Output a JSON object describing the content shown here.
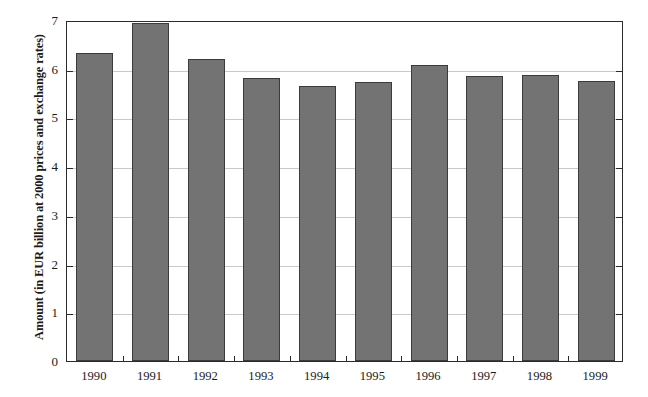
{
  "chart_data": {
    "type": "bar",
    "title": "",
    "subtitle": "",
    "xlabel": "",
    "ylabel": "Amount (in EUR billion at 2000 prices and exchange rates)",
    "categories": [
      "1990",
      "1991",
      "1992",
      "1993",
      "1994",
      "1995",
      "1996",
      "1997",
      "1998",
      "1999"
    ],
    "values": [
      6.33,
      6.93,
      6.2,
      5.8,
      5.64,
      5.72,
      6.07,
      5.86,
      5.88,
      5.74
    ],
    "series": [
      {
        "name": "Amount",
        "values": [
          6.33,
          6.93,
          6.2,
          5.8,
          5.64,
          5.72,
          6.07,
          5.86,
          5.88,
          5.74
        ]
      }
    ],
    "ylim": [
      0,
      7
    ],
    "yticks": [
      0,
      1,
      2,
      3,
      4,
      5,
      6,
      7
    ],
    "ytick_labels": [
      "0",
      "1",
      "2",
      "3",
      "4",
      "5",
      "6",
      "7"
    ],
    "grid": true,
    "grid_axis": "y",
    "legend": false,
    "legend_position": "none",
    "bar_color": "#737373",
    "bar_edge_color": "#3b3b3b",
    "grid_color": "#c9c9c9",
    "axis_color": "#2b2b2b",
    "background_color": "#ffffff"
  }
}
